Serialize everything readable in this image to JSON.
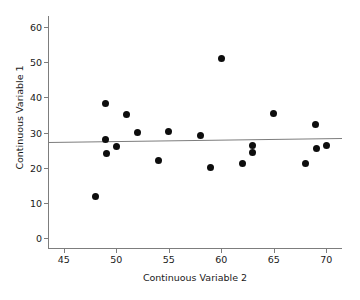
{
  "chart_data": {
    "type": "scatter",
    "title": "",
    "xlabel": "Continuous Variable 2",
    "ylabel": "Continuous Variable 1",
    "xlim": [
      43.5,
      71.5
    ],
    "ylim": [
      -3,
      63
    ],
    "xticks": [
      45,
      50,
      55,
      60,
      65,
      70
    ],
    "yticks": [
      0,
      10,
      20,
      30,
      40,
      50,
      60
    ],
    "xtick_labels": [
      "45",
      "50",
      "55",
      "60",
      "65",
      "70"
    ],
    "ytick_labels": [
      "0",
      "10",
      "20",
      "30",
      "40",
      "50",
      "60"
    ],
    "grid": false,
    "legend": null,
    "marker_color": "#0d0d0d",
    "axis_color": "#7d7d7d",
    "points": [
      {
        "x": 48.0,
        "y": 12.0
      },
      {
        "x": 49.0,
        "y": 38.1
      },
      {
        "x": 49.0,
        "y": 28.0
      },
      {
        "x": 49.1,
        "y": 24.1
      },
      {
        "x": 50.0,
        "y": 26.1
      },
      {
        "x": 51.0,
        "y": 35.1
      },
      {
        "x": 52.0,
        "y": 30.1
      },
      {
        "x": 54.0,
        "y": 22.1
      },
      {
        "x": 55.0,
        "y": 30.2
      },
      {
        "x": 58.0,
        "y": 29.1
      },
      {
        "x": 59.0,
        "y": 20.2
      },
      {
        "x": 60.0,
        "y": 51.1
      },
      {
        "x": 62.0,
        "y": 21.2
      },
      {
        "x": 63.0,
        "y": 26.3
      },
      {
        "x": 63.0,
        "y": 24.3
      },
      {
        "x": 65.0,
        "y": 35.3
      },
      {
        "x": 68.0,
        "y": 21.3
      },
      {
        "x": 69.0,
        "y": 32.3
      },
      {
        "x": 69.1,
        "y": 25.5
      },
      {
        "x": 70.0,
        "y": 26.3
      }
    ],
    "trend_line": {
      "x_start": 43.5,
      "y_start": 27.3,
      "x_end": 71.5,
      "y_end": 28.4,
      "color": "#7d7d7d"
    }
  }
}
